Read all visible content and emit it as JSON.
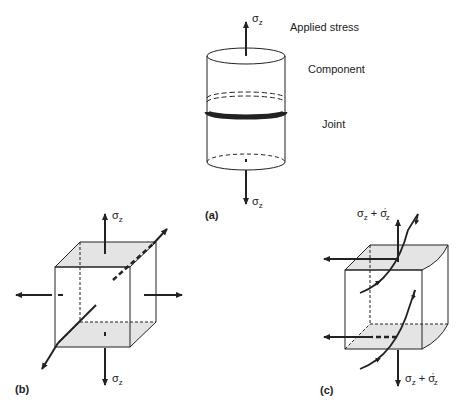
{
  "figure": {
    "panel_a": {
      "label": "(a)",
      "applied_stress_label": "Applied stress",
      "component_label": "Component",
      "joint_label": "Joint",
      "top_arrow": {
        "symbol": "σ",
        "sub": "z"
      },
      "bottom_arrow": {
        "symbol": "σ",
        "sub": "z"
      }
    },
    "panel_b": {
      "label": "(b)",
      "top_arrow": {
        "symbol": "σ",
        "sub": "z"
      },
      "bottom_arrow": {
        "symbol": "σ",
        "sub": "z"
      }
    },
    "panel_c": {
      "label": "(c)",
      "top_arrow": {
        "symbol": "σ",
        "sub": "z",
        "plus": " + ",
        "symbol2": "σ",
        "sub2": "z",
        "prime": "'"
      },
      "bottom_arrow": {
        "symbol": "σ",
        "sub": "z",
        "plus": " + ",
        "symbol2": "σ",
        "sub2": "z",
        "prime": "'"
      }
    },
    "colors": {
      "line": "#222222",
      "shade": "#e4e4e4"
    }
  }
}
